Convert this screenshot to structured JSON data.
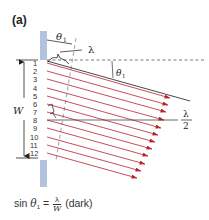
{
  "panel": {
    "label": "(a)"
  },
  "labels": {
    "theta_top": "θ",
    "theta_top_sub": "1",
    "lambda_top": "λ",
    "theta_right": "θ",
    "theta_right_sub": "1",
    "width": "W",
    "half_lambda_num": "λ",
    "half_lambda_den": "2"
  },
  "ray_numbers": [
    "1",
    "2",
    "3",
    "4",
    "5",
    "6",
    "7",
    "8",
    "9",
    "10",
    "11",
    "12"
  ],
  "formula": {
    "prefix": "sin ",
    "theta": "θ",
    "theta_sub": "1",
    "equals": " = ",
    "num": "λ",
    "den": "W",
    "suffix": " (dark)"
  },
  "colors": {
    "slit": "#b4c3dd",
    "ray": "#b5252a",
    "line": "#333333",
    "dashed": "#555555"
  }
}
